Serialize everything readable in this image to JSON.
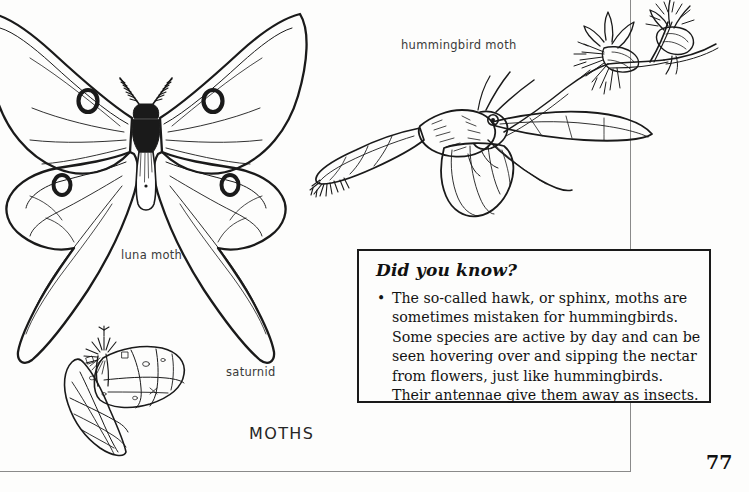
{
  "page": {
    "number": "77",
    "caption": "MOTHS"
  },
  "labels": {
    "luna": "luna moth",
    "saturnid": "saturnid",
    "hummingbird": "hummingbird moth"
  },
  "did_you_know": {
    "title": "Did you know?",
    "bullet_glyph": "•",
    "items": [
      "The so-called hawk, or sphinx, moths are sometimes mistaken for hummingbirds. Some species are active by day and can be seen hovering over and sipping the nectar from flowers, just like hummingbirds. Their antennae give them away as insects."
    ]
  },
  "illustrations": {
    "luna_moth": "luna-moth-illustration",
    "saturnid_moth": "saturnid-moth-illustration",
    "hummingbird_moth": "hummingbird-moth-illustration",
    "flowers": "thistle-flowers-illustration"
  },
  "colors": {
    "ink": "#1a1a1a",
    "rule": "#8a8a8a",
    "paper": "#fdfdfc"
  }
}
